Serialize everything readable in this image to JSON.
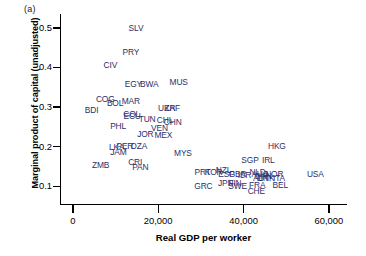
{
  "panel": {
    "tag": "(a)"
  },
  "axes": {
    "xlabel": "Real GDP per worker",
    "ylabel": "Marginal product of capital (unadjusted)",
    "xticks": [
      "0",
      "20,000",
      "40,000",
      "60,000"
    ],
    "yticks": [
      "0.1",
      "0.2",
      "0.3",
      "0.4",
      "0.5"
    ]
  },
  "colors": {
    "label_text": "#2b2f6b",
    "axis": "#000000",
    "background": "#ffffff"
  },
  "chart_data": {
    "type": "scatter",
    "title": "",
    "xlabel": "Real GDP per worker",
    "ylabel": "Marginal product of capital (unadjusted)",
    "xlim": [
      -3000,
      64000
    ],
    "ylim": [
      0.055,
      0.535
    ],
    "xticks": [
      0,
      20000,
      40000,
      60000
    ],
    "yticks": [
      0.1,
      0.2,
      0.3,
      0.4,
      0.5
    ],
    "grid": false,
    "legend": null,
    "point_marker": "text-label",
    "points": [
      {
        "label": "SLV",
        "x": 14800,
        "y": 0.5
      },
      {
        "label": "PRY",
        "x": 13600,
        "y": 0.44
      },
      {
        "label": "CIV",
        "x": 8800,
        "y": 0.405
      },
      {
        "label": "EGY",
        "x": 14200,
        "y": 0.358
      },
      {
        "label": "BWA",
        "x": 17900,
        "y": 0.358
      },
      {
        "label": "MUS",
        "x": 24800,
        "y": 0.362
      },
      {
        "label": "COG",
        "x": 7600,
        "y": 0.32
      },
      {
        "label": "BOL",
        "x": 9900,
        "y": 0.31
      },
      {
        "label": "MAR",
        "x": 13600,
        "y": 0.315
      },
      {
        "label": "BDI",
        "x": 4400,
        "y": 0.292
      },
      {
        "label": "UKR",
        "x": 22000,
        "y": 0.297
      },
      {
        "label": "ZAF",
        "x": 23300,
        "y": 0.297
      },
      {
        "label": "COL",
        "x": 13800,
        "y": 0.283
      },
      {
        "label": "ECU",
        "x": 13900,
        "y": 0.278
      },
      {
        "label": "TUN",
        "x": 17400,
        "y": 0.27
      },
      {
        "label": "CHL",
        "x": 21600,
        "y": 0.268
      },
      {
        "label": "CHN",
        "x": 23400,
        "y": 0.262
      },
      {
        "label": "PHL",
        "x": 10600,
        "y": 0.253
      },
      {
        "label": "VEN",
        "x": 20300,
        "y": 0.248
      },
      {
        "label": "JOR",
        "x": 17000,
        "y": 0.233
      },
      {
        "label": "MEX",
        "x": 21200,
        "y": 0.229
      },
      {
        "label": "LKA",
        "x": 10300,
        "y": 0.2
      },
      {
        "label": "PER",
        "x": 12200,
        "y": 0.202
      },
      {
        "label": "DZA",
        "x": 15500,
        "y": 0.202
      },
      {
        "label": "JAM",
        "x": 10700,
        "y": 0.186
      },
      {
        "label": "MYS",
        "x": 25800,
        "y": 0.184
      },
      {
        "label": "CRI",
        "x": 14600,
        "y": 0.162
      },
      {
        "label": "ZMB",
        "x": 6500,
        "y": 0.154
      },
      {
        "label": "PAN",
        "x": 15800,
        "y": 0.148
      },
      {
        "label": "HKG",
        "x": 47800,
        "y": 0.202
      },
      {
        "label": "SGP",
        "x": 41500,
        "y": 0.165
      },
      {
        "label": "IRL",
        "x": 45800,
        "y": 0.165
      },
      {
        "label": "PRT",
        "x": 30400,
        "y": 0.135
      },
      {
        "label": "KOR",
        "x": 33000,
        "y": 0.135
      },
      {
        "label": "NZL",
        "x": 35300,
        "y": 0.14
      },
      {
        "label": "ESP",
        "x": 36000,
        "y": 0.13
      },
      {
        "label": "GBR",
        "x": 38600,
        "y": 0.13
      },
      {
        "label": "ISR",
        "x": 40200,
        "y": 0.128
      },
      {
        "label": "NLD",
        "x": 43300,
        "y": 0.136
      },
      {
        "label": "AUS",
        "x": 43800,
        "y": 0.131
      },
      {
        "label": "CAN",
        "x": 44600,
        "y": 0.126
      },
      {
        "label": "NOR",
        "x": 47200,
        "y": 0.132
      },
      {
        "label": "AUT",
        "x": 44100,
        "y": 0.12
      },
      {
        "label": "DNK",
        "x": 45200,
        "y": 0.12
      },
      {
        "label": "ITA",
        "x": 48300,
        "y": 0.12
      },
      {
        "label": "USA",
        "x": 56800,
        "y": 0.131
      },
      {
        "label": "GRC",
        "x": 30600,
        "y": 0.1
      },
      {
        "label": "JPN",
        "x": 35800,
        "y": 0.108
      },
      {
        "label": "FIN",
        "x": 38000,
        "y": 0.107
      },
      {
        "label": "SWE",
        "x": 38600,
        "y": 0.1
      },
      {
        "label": "FRA",
        "x": 43200,
        "y": 0.104
      },
      {
        "label": "BEL",
        "x": 48600,
        "y": 0.104
      },
      {
        "label": "CHE",
        "x": 43000,
        "y": 0.088
      }
    ]
  }
}
